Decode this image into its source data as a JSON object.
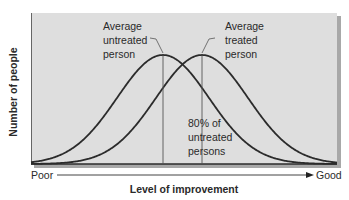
{
  "chart_data": {
    "type": "line",
    "title": "",
    "xlabel": "Level of improvement",
    "ylabel": "Number of people",
    "x_axis_ends": {
      "left": "Poor",
      "right": "Good"
    },
    "grid": false,
    "legend": "none",
    "series": [
      {
        "name": "Untreated",
        "distribution": "normal",
        "mean_px": 163,
        "sd_px": 46,
        "peak_height": 1.0
      },
      {
        "name": "Treated",
        "distribution": "normal",
        "mean_px": 202,
        "sd_px": 46,
        "peak_height": 1.0
      }
    ],
    "annotations": [
      {
        "text": [
          "Average",
          "untreated",
          "person"
        ],
        "points_to": "Untreated peak"
      },
      {
        "text": [
          "Average",
          "treated",
          "person"
        ],
        "points_to": "Treated peak"
      },
      {
        "text": [
          "80% of",
          "untreated",
          "persons"
        ],
        "refers_to": "portion of untreated distribution below treated mean"
      }
    ]
  },
  "labels": {
    "ylabel": "Number of people",
    "xlabel": "Level of improvement",
    "poor": "Poor",
    "good": "Good",
    "untreated": [
      "Average",
      "untreated",
      "person"
    ],
    "treated": [
      "Average",
      "treated",
      "person"
    ],
    "pct": [
      "80% of",
      "untreated",
      "persons"
    ]
  },
  "colors": {
    "panel": "#dedede",
    "panel_shadow": "#9a9a9a",
    "curve": "#2b2b2b",
    "marker_line": "#555555",
    "text": "#2a2a2a"
  }
}
